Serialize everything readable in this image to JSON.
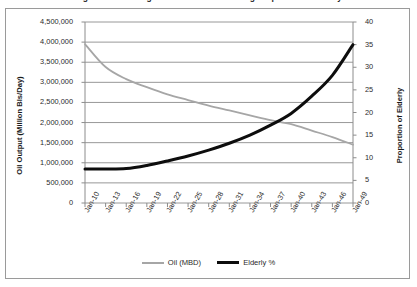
{
  "chart_data": {
    "type": "line",
    "title": "Figure 1: Declining Oil Production vs. Rising Proportion of Elderly",
    "xlabel": "",
    "ylabel": "Oil Output (Million Bls/Day)",
    "y2label": "Proportion of Elderly",
    "grid": true,
    "legend_position": "bottom",
    "ylim": [
      0,
      4500000
    ],
    "y2lim": [
      0,
      40
    ],
    "yticks": [
      "0",
      "500,000",
      "1,000,000",
      "1,500,000",
      "2,000,000",
      "2,500,000",
      "3,000,000",
      "3,500,000",
      "4,000,000",
      "4,500,000"
    ],
    "ytick_values": [
      0,
      500000,
      1000000,
      1500000,
      2000000,
      2500000,
      3000000,
      3500000,
      4000000,
      4500000
    ],
    "y2ticks": [
      "0",
      "5",
      "10",
      "15",
      "20",
      "25",
      "30",
      "35",
      "40"
    ],
    "y2tick_values": [
      0,
      5,
      10,
      15,
      20,
      25,
      30,
      35,
      40
    ],
    "categories": [
      "Jan-10",
      "Jan-13",
      "Jan-16",
      "Jan-19",
      "Jan-22",
      "Jan-25",
      "Jan-28",
      "Jan-31",
      "Jan-34",
      "Jan-37",
      "Jan-40",
      "Jan-43",
      "Jan-46",
      "Jan-49"
    ],
    "series": [
      {
        "name": "Oil (MBD)",
        "axis": "left",
        "color": "#a6a6a6",
        "width": 1.8,
        "values": [
          3950000,
          3380000,
          3080000,
          2880000,
          2700000,
          2560000,
          2420000,
          2300000,
          2180000,
          2060000,
          1960000,
          1800000,
          1640000,
          1450000
        ]
      },
      {
        "name": "Elderly %",
        "axis": "right",
        "color": "#0d0d0d",
        "width": 3.0,
        "values": [
          7.5,
          7.5,
          7.6,
          8.3,
          9.3,
          10.4,
          11.7,
          13.2,
          15.0,
          17.2,
          19.8,
          23.6,
          28.2,
          35.0
        ]
      }
    ]
  },
  "legend": {
    "items": [
      {
        "label": "Oil (MBD)"
      },
      {
        "label": "Elderly %"
      }
    ]
  }
}
